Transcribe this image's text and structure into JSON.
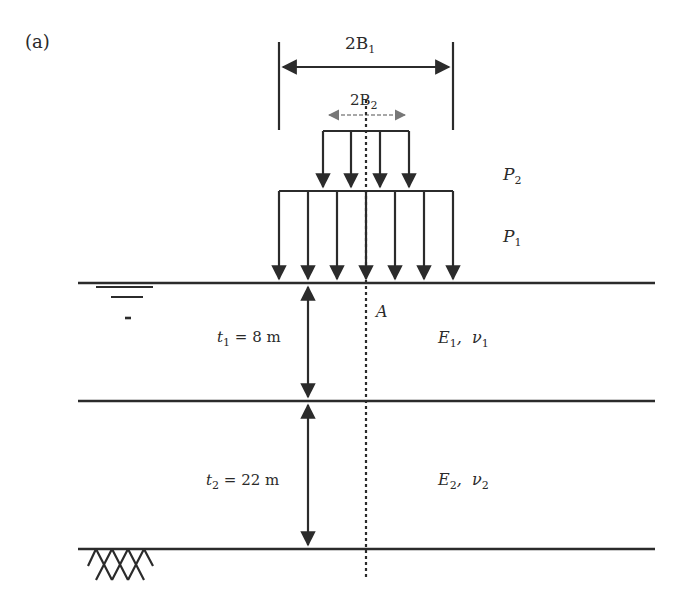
{
  "figure": {
    "panel_label": "(a)",
    "dimensions": {
      "outer_width": {
        "prefix": "2B",
        "sub": "1"
      },
      "inner_width": {
        "prefix": "2B",
        "sub": "2"
      }
    },
    "loads": {
      "upper": {
        "symbol": "P",
        "sub": "2"
      },
      "lower": {
        "symbol": "P",
        "sub": "1"
      }
    },
    "point_label": "A",
    "layers": [
      {
        "thickness_symbol": "t",
        "thickness_sub": "1",
        "thickness_value": " = 8 m",
        "modulus": "E",
        "modulus_sub": "1",
        "poisson": "ν",
        "poisson_sub": "1"
      },
      {
        "thickness_symbol": "t",
        "thickness_sub": "2",
        "thickness_value": " = 22 m",
        "modulus": "E",
        "modulus_sub": "2",
        "poisson": "ν",
        "poisson_sub": "2"
      }
    ],
    "symbols": {
      "water_table": "water-table-icon",
      "rigid_base": "rigid-base-hatch-icon"
    },
    "colors": {
      "line": "#2b2b2b",
      "faint": "#9a9a9a"
    }
  }
}
